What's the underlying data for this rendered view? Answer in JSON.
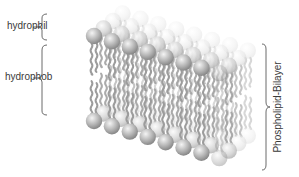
{
  "labels": {
    "hydrophilic": "hydrophil",
    "hydrophobic": "hydrophob",
    "bilayer": "Phospholipid-Bilayer"
  },
  "diagram": {
    "columns": 8,
    "depth_rows": 4,
    "parts": [
      "hydrophilic head",
      "hydrophobic tails"
    ],
    "colors": {
      "head_front": "#9a9a9a",
      "head_back": "#e2e2e2",
      "tail": "#9c9c9c",
      "bracket": "#5a5a5a",
      "text": "#3a3a3a"
    }
  }
}
